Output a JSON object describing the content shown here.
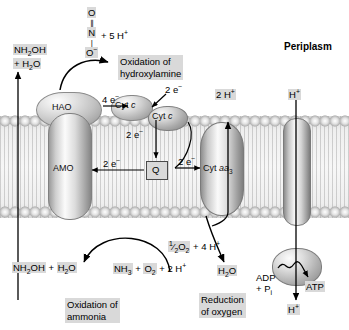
{
  "figure": {
    "compartment_label": "Periplasm",
    "title_unlabeled": ""
  },
  "proteins": [
    {
      "name": "HAO",
      "label": "HAO"
    },
    {
      "name": "AMO",
      "label": "AMO"
    },
    {
      "name": "cytochrome-c-1",
      "label": "Cyt c"
    },
    {
      "name": "cytochrome-c-2",
      "label": "Cyt c"
    },
    {
      "name": "cytochrome-aa3",
      "label": "Cyt aa3"
    },
    {
      "name": "quinone",
      "label": "Q"
    }
  ],
  "labels": {
    "hao": "HAO",
    "amo": "AMO",
    "cyt_c_1": "Cyt c",
    "cyt_c_2": "Cyt c",
    "cyt_aa3_prefix": "Cyt ",
    "cyt_aa3_italic": "aa",
    "cyt_aa3_sub": "3",
    "quinone": "Q"
  },
  "metabolites": {
    "hydroxylamine_periplasm": "NH2OH + H2O",
    "hydroxylamine_periplasm_line1": "NH2OH",
    "hydroxylamine_periplasm_line2": "+ H2O",
    "nitrite_O_top": "O",
    "nitrite_N": "N",
    "nitrite_O_bottom": "O-",
    "nitrite_protons": "+ 5 H+",
    "protons_pumped": "2 H+",
    "proton_influx": "H+",
    "oxygen_half": "1/2 O2 + 4 H+",
    "water": "H2O",
    "hydroxylamine_cytoplasm": "NH2OH + H2O",
    "ammonia_substrate": "NH3 + O2 + 2 H+",
    "adp": "ADP",
    "phosphate": "+ Pi",
    "atp": "ATP",
    "proton_exit": "H+"
  },
  "electron_labels": {
    "hao_to_cytc": "4 e-",
    "cytc_to_cytc": "2 e-",
    "cytc_to_q": "2 e-",
    "q_to_amo": "2 e-",
    "cytc_to_aa3": "2 e-"
  },
  "captions": {
    "oxidation_hydroxylamine_line1": "Oxidation of",
    "oxidation_hydroxylamine_line2": "hydroxylamine",
    "oxidation_ammonia_line1": "Oxidation of",
    "oxidation_ammonia_line2": "ammonia",
    "reduction_oxygen_line1": "Reduction",
    "reduction_oxygen_line2": "of oxygen"
  },
  "colors": {
    "highlight": "#d9d9d9",
    "membrane_light": "#f7f7f7",
    "membrane_dark": "#d8d8d8",
    "stroke": "#000000"
  }
}
